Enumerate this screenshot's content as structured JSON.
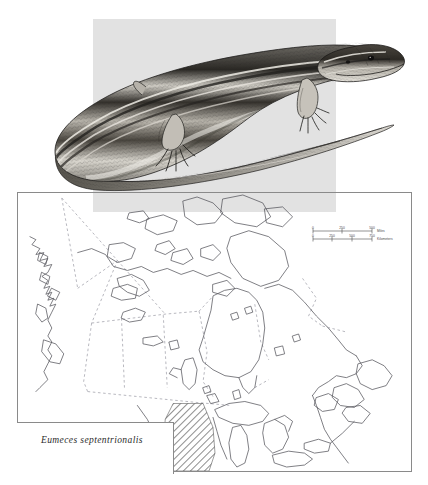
{
  "plate": {
    "kind": "field-guide-plate",
    "illustration": {
      "subject": "five-lined skink lizard, lateral view, pen-and-ink stipple engraving",
      "panel_color": "#e2e2e2",
      "ink_color": "#1b1b1b"
    },
    "map": {
      "title": "",
      "region": "Canada and northern United States",
      "frame_color": "#8a8a8a",
      "coast_color": "#55555a",
      "border_color": "#9a9aa2",
      "range_hatch_color": "#3a3a3a",
      "scalebar": {
        "miles": {
          "unit_label": "Miles",
          "ticks": [
            "0",
            "250",
            "500"
          ]
        },
        "kilometers": {
          "unit_label": "Kilometers",
          "ticks": [
            "0",
            "250",
            "500",
            "750"
          ]
        }
      },
      "legend": {
        "species_name": "Eumeces septentrionalis"
      }
    }
  }
}
